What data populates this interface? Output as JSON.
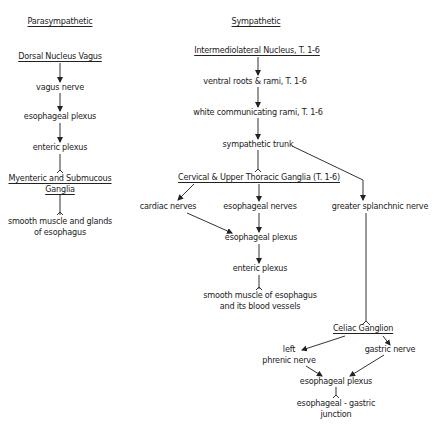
{
  "diagram": {
    "columns": {
      "parasympathetic": {
        "heading": "Parasympathetic",
        "nodes": {
          "dorsal_nucleus": "Dorsal Nucleus Vagus",
          "vagus_nerve": "vagus nerve",
          "esophageal_plexus": "esophageal plexus",
          "enteric_plexus": "enteric plexus",
          "myenteric_ganglia": [
            "Myenteric and Submucous",
            "Ganglia"
          ],
          "target": [
            "smooth muscle and glands",
            "of esophagus"
          ]
        }
      },
      "sympathetic": {
        "heading": "Sympathetic",
        "nodes": {
          "intermediolateral": "Intermediolateral Nucleus, T. 1-6",
          "ventral_roots": "ventral roots & rami, T. 1-6",
          "white_rami": "white communicating rami, T. 1-6",
          "sympathetic_trunk": "sympathetic trunk",
          "cervical_ganglia": "Cervical & Upper Thoracic Ganglia (T. 1-6)",
          "cardiac_nerves": "cardiac nerves",
          "esophageal_nerves": "esophageal nerves",
          "greater_splanchnic": "greater splanchnic nerve",
          "esophageal_plexus": "esophageal plexus",
          "enteric_plexus": "enteric plexus",
          "target": [
            "smooth muscle of esophagus",
            "and its blood vessels"
          ],
          "celiac_ganglion": "Celiac Ganglion",
          "left_phrenic": [
            "left",
            "phrenic nerve"
          ],
          "gastric_nerve": "gastric nerve",
          "esophageal_plexus_2": "esophageal plexus",
          "ge_junction": [
            "esophageal - gastric",
            "junction"
          ]
        }
      }
    },
    "edges": [
      [
        "Dorsal Nucleus Vagus",
        "vagus nerve"
      ],
      [
        "vagus nerve",
        "esophageal plexus"
      ],
      [
        "esophageal plexus",
        "enteric plexus"
      ],
      [
        "enteric plexus",
        "Myenteric and Submucous Ganglia"
      ],
      [
        "Myenteric and Submucous Ganglia",
        "smooth muscle and glands of esophagus"
      ],
      [
        "Intermediolateral Nucleus, T. 1-6",
        "ventral roots & rami, T. 1-6"
      ],
      [
        "ventral roots & rami, T. 1-6",
        "white communicating rami, T. 1-6"
      ],
      [
        "white communicating rami, T. 1-6",
        "sympathetic trunk"
      ],
      [
        "sympathetic trunk",
        "Cervical & Upper Thoracic Ganglia (T. 1-6)"
      ],
      [
        "sympathetic trunk",
        "greater splanchnic nerve"
      ],
      [
        "Cervical & Upper Thoracic Ganglia (T. 1-6)",
        "cardiac nerves"
      ],
      [
        "Cervical & Upper Thoracic Ganglia (T. 1-6)",
        "esophageal nerves"
      ],
      [
        "cardiac nerves",
        "esophageal plexus"
      ],
      [
        "esophageal nerves",
        "esophageal plexus"
      ],
      [
        "esophageal plexus",
        "enteric plexus"
      ],
      [
        "enteric plexus",
        "smooth muscle of esophagus and its blood vessels"
      ],
      [
        "greater splanchnic nerve",
        "Celiac Ganglion"
      ],
      [
        "Celiac Ganglion",
        "left phrenic nerve"
      ],
      [
        "Celiac Ganglion",
        "gastric nerve"
      ],
      [
        "left phrenic nerve",
        "esophageal plexus"
      ],
      [
        "gastric nerve",
        "esophageal plexus"
      ],
      [
        "esophageal plexus",
        "esophageal - gastric junction"
      ]
    ]
  }
}
